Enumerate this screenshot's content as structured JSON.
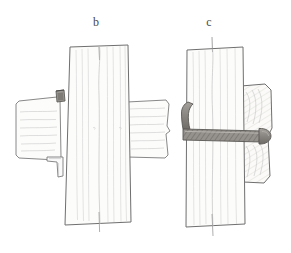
{
  "figure": {
    "title": "",
    "background_color": "#ffffff",
    "ink_color": "#6f6f6f",
    "ink_dark_color": "#4a4a4a",
    "grain_color": "#bdbdbd",
    "metal_fill_color": "#8d8a86",
    "wood_fill_color": "#fbfbfa",
    "medium": "pencil sketch",
    "panel_count": 2
  },
  "panels": [
    {
      "id": "b",
      "label": "b",
      "label_x": 96,
      "label_y": 26,
      "caption": "",
      "description": "Timber post with through-beam and strap/peg fastening detail",
      "parts": [
        {
          "name": "vertical-post",
          "orientation": "vertical",
          "fill": "#fbfbfa"
        },
        {
          "name": "left-beam",
          "orientation": "horizontal",
          "fill": "#fbfbfa"
        },
        {
          "name": "right-beam",
          "orientation": "horizontal",
          "fill": "#fbfbfa"
        },
        {
          "name": "upper-peg",
          "fill": "#8d8a86"
        },
        {
          "name": "lower-peg",
          "fill": "#8d8a86"
        },
        {
          "name": "post-center-seam",
          "fill": "none"
        }
      ]
    },
    {
      "id": "c",
      "label": "c",
      "label_x": 209,
      "label_y": 26,
      "caption": "",
      "description": "Timber post with hooked iron through-bolt and shaped timber bearing block",
      "parts": [
        {
          "name": "vertical-post",
          "orientation": "vertical",
          "fill": "#fbfbfa"
        },
        {
          "name": "hooked-bolt",
          "orientation": "horizontal",
          "fill": "#8d8a86"
        },
        {
          "name": "bolt-head",
          "fill": "#8d8a86"
        },
        {
          "name": "bearing-block",
          "orientation": "vertical",
          "fill": "#fbfbfa"
        },
        {
          "name": "post-center-seam",
          "fill": "none"
        }
      ]
    }
  ]
}
